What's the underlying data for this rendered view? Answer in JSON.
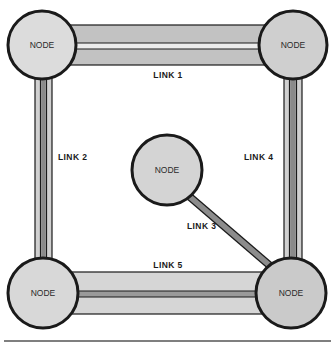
{
  "diagram": {
    "type": "network-topology",
    "colors": {
      "node_fill": "#d4d4d4",
      "node_stroke": "#1a1a1a",
      "link_fill": "#bdbdbd",
      "link_light": "#e2e2e2",
      "link_dark": "#6e6e6e",
      "rule": "#555555"
    },
    "nodes": [
      {
        "id": "n1",
        "label": "NODE",
        "position": "top-left"
      },
      {
        "id": "n2",
        "label": "NODE",
        "position": "top-right"
      },
      {
        "id": "n3",
        "label": "NODE",
        "position": "center"
      },
      {
        "id": "n4",
        "label": "NODE",
        "position": "bottom-left"
      },
      {
        "id": "n5",
        "label": "NODE",
        "position": "bottom-right"
      }
    ],
    "links": [
      {
        "id": "l1",
        "label": "LINK 1",
        "from": "n1",
        "to": "n2",
        "style": "wide-double"
      },
      {
        "id": "l2",
        "label": "LINK 2",
        "from": "n1",
        "to": "n4",
        "style": "narrow-triple"
      },
      {
        "id": "l3",
        "label": "LINK 3",
        "from": "n3",
        "to": "n5",
        "style": "single"
      },
      {
        "id": "l4",
        "label": "LINK 4",
        "from": "n2",
        "to": "n5",
        "style": "narrow-triple"
      },
      {
        "id": "l5",
        "label": "LINK 5",
        "from": "n4",
        "to": "n5",
        "style": "wide-double"
      }
    ]
  }
}
